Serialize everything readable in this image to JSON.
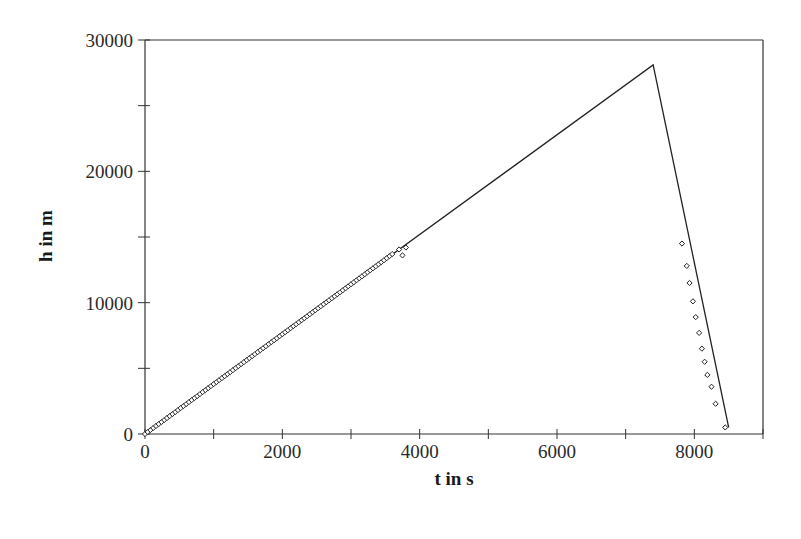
{
  "chart_data": {
    "type": "line",
    "title": "",
    "xlabel": "t in s",
    "ylabel": "h in m",
    "xlim": [
      0,
      9000
    ],
    "ylim": [
      0,
      30000
    ],
    "x_ticks": [
      0,
      2000,
      4000,
      6000,
      8000
    ],
    "x_minor_ticks": [
      1000,
      3000,
      5000,
      7000,
      9000
    ],
    "y_ticks": [
      0,
      10000,
      20000,
      30000
    ],
    "y_minor_ticks": [
      5000,
      15000,
      25000
    ],
    "x_tick_labels": [
      "0",
      "2000",
      "4000",
      "6000",
      "8000"
    ],
    "y_tick_labels": [
      "0",
      "10000",
      "20000",
      "30000"
    ],
    "grid": false,
    "legend": null,
    "series": [
      {
        "name": "model (line)",
        "style": "line",
        "x": [
          0,
          7400,
          8500
        ],
        "y": [
          0,
          28100,
          500
        ]
      },
      {
        "name": "measured ascent (markers)",
        "style": "markers",
        "marker": "open-diamond",
        "x": [
          0,
          200,
          400,
          600,
          800,
          1000,
          1200,
          1400,
          1600,
          1800,
          2000,
          2200,
          2400,
          2600,
          2800,
          3000,
          3200,
          3400,
          3600,
          3700,
          3750,
          3800
        ],
        "y": [
          0,
          760,
          1520,
          2280,
          3040,
          3800,
          4560,
          5320,
          6080,
          6840,
          7600,
          8360,
          9120,
          9880,
          10640,
          11400,
          12160,
          12920,
          13700,
          14050,
          13600,
          14200
        ]
      },
      {
        "name": "measured descent (markers)",
        "style": "markers",
        "marker": "open-diamond",
        "x": [
          7820,
          7890,
          7930,
          7980,
          8020,
          8070,
          8110,
          8150,
          8190,
          8250,
          8310,
          8450
        ],
        "y": [
          14500,
          12800,
          11500,
          10100,
          8900,
          7700,
          6500,
          5500,
          4500,
          3600,
          2300,
          500
        ]
      }
    ]
  }
}
